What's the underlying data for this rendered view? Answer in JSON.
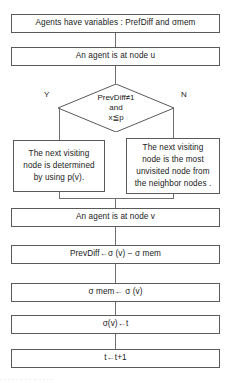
{
  "diagram": {
    "type": "flowchart",
    "orientation": "top-to-bottom"
  },
  "nodes": {
    "variables": {
      "shape": "rectangle",
      "text": "Agents have variables : PrefDiff and σmem"
    },
    "agent_at_u": {
      "shape": "rectangle",
      "text": "An agent is at node u"
    },
    "decision": {
      "shape": "diamond",
      "line1": "PrevDiff≠1",
      "line2": "and",
      "line3": "x≦p"
    },
    "branch_yes": {
      "shape": "rectangle",
      "line1": "The next visiting",
      "line2": "node is determined",
      "line3": "by using p(v)."
    },
    "branch_no": {
      "shape": "rectangle",
      "line1": "The next visiting",
      "line2": "node is the most",
      "line3": "unvisited node from",
      "line4": "the neighbor nodes ."
    },
    "agent_at_v": {
      "shape": "rectangle",
      "text": "An agent is at node v"
    },
    "prevdiff_update": {
      "shape": "rectangle",
      "text": "PrevDiff←σ (v) − σ mem"
    },
    "sigma_mem_update": {
      "shape": "rectangle",
      "text": "σ mem← σ (v)"
    },
    "sigma_v_update": {
      "shape": "rectangle",
      "text": "σ(v)←t"
    },
    "t_increment": {
      "shape": "rectangle",
      "text": "t←t+1"
    }
  },
  "edge_labels": {
    "yes": "Y",
    "no": "N"
  },
  "colors": {
    "border": "#5a5a5a",
    "connector": "#6e6e6e",
    "text": "#1a1a1a",
    "background": "#ffffff"
  },
  "caption_fragment": ". .    .    . .  ..  . . ..  .   . .     ."
}
